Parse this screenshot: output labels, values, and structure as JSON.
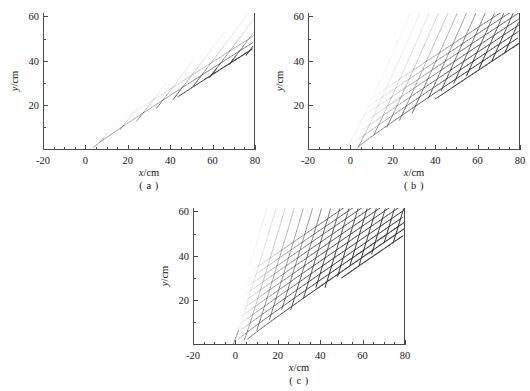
{
  "figure": {
    "type": "multi-panel-contour-figure",
    "panel_count": 3,
    "background_color": "#ffffff",
    "line_color": "#3a3a3a"
  },
  "axes": {
    "xlabel": "x/cm",
    "ylabel": "y/cm",
    "xlabel_symbol": "x",
    "xlabel_unit": "/cm",
    "ylabel_symbol": "y",
    "ylabel_unit": "/cm",
    "x_ticks": [
      "-20",
      "0",
      "20",
      "40",
      "60",
      "80"
    ],
    "x_tick_values": [
      -20,
      0,
      20,
      40,
      60,
      80
    ],
    "y_ticks": [
      "20",
      "40",
      "60"
    ],
    "y_tick_values": [
      20,
      40,
      60
    ],
    "xlim": [
      -20,
      80
    ],
    "ylim": [
      0,
      62
    ],
    "x_minor_interval": 5,
    "y_minor_interval": 10,
    "grid": false,
    "legend": "none"
  },
  "captions": {
    "a": "( a )",
    "b": "( b )",
    "c": "( c )"
  },
  "chart_data": [
    {
      "panel": "a",
      "caption": "( a )",
      "type": "contour",
      "title": "",
      "xlabel": "x/cm",
      "ylabel": "y/cm",
      "xlim": [
        -20,
        80
      ],
      "ylim": [
        0,
        62
      ],
      "xticks": [
        -20,
        0,
        20,
        40,
        60,
        80
      ],
      "yticks": [
        20,
        40,
        60
      ],
      "grid": false,
      "description": "Narrow wake wedge of crossing wave crests emanating from the origin (0,0); diamond interference lattice confined inside a wedge whose upper boundary rises from (0,0) toward (80,60) and lower boundary runs from (0,0) toward (80,46).",
      "source_point": [
        0,
        0
      ],
      "wedge_upper_boundary": [
        [
          0,
          0
        ],
        [
          80,
          60
        ]
      ],
      "wedge_lower_boundary": [
        [
          0,
          0
        ],
        [
          80,
          46
        ]
      ],
      "pattern_onset_x": 0,
      "fill_density": "sparse",
      "wave_families": 2,
      "crest_spacing_cm": 4.5
    },
    {
      "panel": "b",
      "caption": "( b )",
      "type": "contour",
      "title": "",
      "xlabel": "x/cm",
      "ylabel": "y/cm",
      "xlim": [
        -20,
        80
      ],
      "ylim": [
        0,
        62
      ],
      "xticks": [
        -20,
        0,
        20,
        40,
        60,
        80
      ],
      "yticks": [
        20,
        40,
        60
      ],
      "grid": false,
      "description": "Wider wake wedge of crossing wave crests from the origin; the diamond interference lattice extends left to about x = -8 at the top of the frame and is denser than panel (a).",
      "source_point": [
        0,
        0
      ],
      "wedge_upper_boundary": [
        [
          0,
          0
        ],
        [
          -8,
          62
        ]
      ],
      "wedge_lower_boundary": [
        [
          0,
          0
        ],
        [
          80,
          48
        ]
      ],
      "pattern_onset_x": -8,
      "fill_density": "medium",
      "wave_families": 2,
      "crest_spacing_cm": 4.5
    },
    {
      "panel": "c",
      "caption": "( c )",
      "type": "contour",
      "title": "",
      "xlabel": "x/cm",
      "ylabel": "y/cm",
      "xlim": [
        -20,
        80
      ],
      "ylim": [
        0,
        62
      ],
      "xticks": [
        -20,
        0,
        20,
        40,
        60,
        80
      ],
      "yticks": [
        20,
        40,
        60
      ],
      "grid": false,
      "description": "Fully developed wake: the diamond interference lattice of crossing wave crests fills the whole plot area above the lower wedge boundary running from the origin toward (80,50); darkest crests concentrate along that lower boundary.",
      "source_point": [
        0,
        0
      ],
      "wedge_upper_boundary": [
        [
          -20,
          62
        ],
        [
          -20,
          0
        ]
      ],
      "wedge_lower_boundary": [
        [
          0,
          0
        ],
        [
          80,
          50
        ]
      ],
      "pattern_onset_x": -20,
      "fill_density": "full",
      "wave_families": 2,
      "crest_spacing_cm": 4.5
    }
  ]
}
